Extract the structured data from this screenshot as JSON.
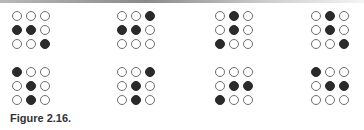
{
  "figure": {
    "caption": "Figure 2.16.",
    "grids": [
      {
        "row": 0,
        "col": 0,
        "x": 12,
        "y": 11,
        "cells": [
          [
            0,
            0,
            0
          ],
          [
            1,
            1,
            0
          ],
          [
            0,
            0,
            1
          ]
        ]
      },
      {
        "row": 0,
        "col": 1,
        "x": 117,
        "y": 11,
        "cells": [
          [
            0,
            0,
            1
          ],
          [
            1,
            1,
            0
          ],
          [
            0,
            0,
            0
          ]
        ]
      },
      {
        "row": 0,
        "col": 2,
        "x": 215,
        "y": 11,
        "cells": [
          [
            0,
            1,
            0
          ],
          [
            0,
            1,
            0
          ],
          [
            1,
            0,
            0
          ]
        ]
      },
      {
        "row": 0,
        "col": 3,
        "x": 311,
        "y": 11,
        "cells": [
          [
            0,
            1,
            0
          ],
          [
            0,
            1,
            0
          ],
          [
            0,
            0,
            1
          ]
        ]
      },
      {
        "row": 1,
        "col": 0,
        "x": 12,
        "y": 67,
        "cells": [
          [
            1,
            0,
            0
          ],
          [
            0,
            1,
            0
          ],
          [
            0,
            1,
            0
          ]
        ]
      },
      {
        "row": 1,
        "col": 1,
        "x": 117,
        "y": 67,
        "cells": [
          [
            0,
            0,
            1
          ],
          [
            0,
            1,
            0
          ],
          [
            0,
            1,
            0
          ]
        ]
      },
      {
        "row": 1,
        "col": 2,
        "x": 215,
        "y": 67,
        "cells": [
          [
            0,
            0,
            0
          ],
          [
            0,
            1,
            1
          ],
          [
            1,
            0,
            0
          ]
        ]
      },
      {
        "row": 1,
        "col": 3,
        "x": 311,
        "y": 67,
        "cells": [
          [
            1,
            0,
            0
          ],
          [
            0,
            1,
            1
          ],
          [
            0,
            0,
            0
          ]
        ]
      }
    ]
  },
  "colors": {
    "filled": "#2a2a2a",
    "outline": "#6e6e6e",
    "background": "#ffffff"
  }
}
